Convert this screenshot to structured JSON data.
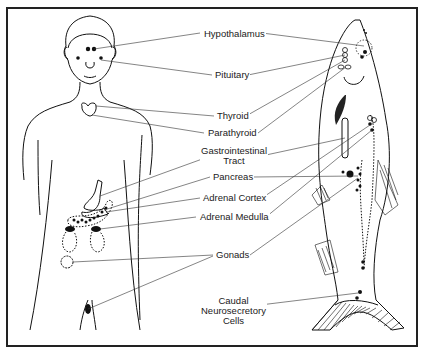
{
  "diagram": {
    "labels": [
      {
        "id": "hypothalamus",
        "text": "Hypothalamus",
        "x": 203,
        "y": 31
      },
      {
        "id": "pituitary",
        "text": "Pituitary",
        "x": 215,
        "y": 70
      },
      {
        "id": "thyroid",
        "text": "Thyroid",
        "x": 217,
        "y": 111
      },
      {
        "id": "parathyroid",
        "text": "Parathyroid",
        "x": 207,
        "y": 128
      },
      {
        "id": "gastrointestinal",
        "text": "Gastrointestinal\nTract",
        "x": 200,
        "y": 146
      },
      {
        "id": "pancreas",
        "text": "Pancreas",
        "x": 212,
        "y": 172
      },
      {
        "id": "adrenal-cortex",
        "text": "Adrenal Cortex",
        "x": 202,
        "y": 193
      },
      {
        "id": "adrenal-medulla",
        "text": "Adrenal Medulla",
        "x": 199,
        "y": 212
      },
      {
        "id": "gonads",
        "text": "Gonads",
        "x": 215,
        "y": 250
      },
      {
        "id": "caudal",
        "text": "Caudal\nNeurosecretory\nCells",
        "x": 200,
        "y": 300
      }
    ]
  }
}
